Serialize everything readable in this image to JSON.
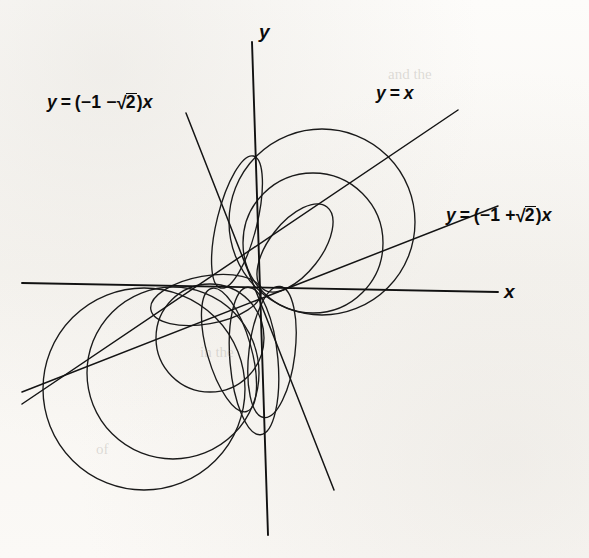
{
  "figure": {
    "kind": "polar-circles-through-origin",
    "background_color": "#fbfaf8",
    "ink_color": "#1a1a1a",
    "origin": {
      "x": 259,
      "y": 288
    },
    "axis_labels": {
      "x": "x",
      "y": "y"
    },
    "line_labels": [
      {
        "id": "line-neg-sqrt2",
        "text_parts": {
          "lhs": "y",
          "eq": "=",
          "open": "(−1 −",
          "radical": "2",
          "close": ")",
          "var": "x"
        },
        "plain": "y = (−1 − √2)x",
        "slope": -2.4142,
        "x": 47,
        "y": 100
      },
      {
        "id": "line-y-eq-x",
        "text_parts": {
          "lhs": "y",
          "eq": "=",
          "var": "x"
        },
        "plain": "y = x",
        "slope": 1.0,
        "x": 376,
        "y": 92
      },
      {
        "id": "line-pos-sqrt2",
        "text_parts": {
          "lhs": "y",
          "eq": "=",
          "open": "(−1 +",
          "radical": "2",
          "close": ")",
          "var": "x"
        },
        "plain": "y = (−1 + √2)x",
        "slope": 0.4142,
        "x": 446,
        "y": 213
      }
    ]
  },
  "chart_data": {
    "type": "line",
    "title": "",
    "xlabel": "x",
    "ylabel": "y",
    "grid": false,
    "legend": "none",
    "axes": {
      "x_axis": {
        "x1": 22,
        "y1": 283,
        "x2": 498,
        "y2": 292
      },
      "y_axis": {
        "x1": 252,
        "y1": 42,
        "x2": 268,
        "y2": 535
      }
    },
    "lines_through_origin": [
      {
        "name": "y = (−1 − √2)x",
        "slope": -2.4142,
        "x1": 186,
        "y1": 113,
        "x2": 334,
        "y2": 490
      },
      {
        "name": "y = x",
        "slope": 1.0,
        "x1": 22,
        "y1": 404,
        "x2": 458,
        "y2": 110
      },
      {
        "name": "y = (−1 + √2)x",
        "slope": 0.4142,
        "x1": 22,
        "y1": 392,
        "x2": 498,
        "y2": 206
      }
    ],
    "circles": [
      {
        "name": "upper-large",
        "cx": 322,
        "cy": 222,
        "r": 93,
        "tangent_line": "y = (−1 − √2)x"
      },
      {
        "name": "upper-small",
        "cx": 313,
        "cy": 243,
        "r": 70,
        "tangent_line": "y = (−1 − √2)x"
      },
      {
        "name": "lower-large",
        "cx": 144,
        "cy": 389,
        "r": 101,
        "tangent_line": "y = (−1 − √2)x"
      },
      {
        "name": "lower-mid",
        "cx": 173,
        "cy": 373,
        "r": 86,
        "tangent_line": "y = x"
      },
      {
        "name": "lower-small",
        "cx": 210,
        "cy": 338,
        "r": 54,
        "tangent_line": "y = (−1 + √2)x"
      },
      {
        "name": "petal-narrow-left",
        "cx": 196,
        "cy": 318,
        "r": 40,
        "tangent_line": "y = (−1 + √2)x"
      },
      {
        "name": "petal-narrow-down",
        "cx": 247,
        "cy": 355,
        "r": 68,
        "tangent_line": "y = x"
      }
    ]
  },
  "ghost_text": [
    {
      "text": "and the",
      "x": 388,
      "y": 74
    },
    {
      "text": "in the",
      "x": 200,
      "y": 352
    },
    {
      "text": "of",
      "x": 96,
      "y": 449
    }
  ]
}
